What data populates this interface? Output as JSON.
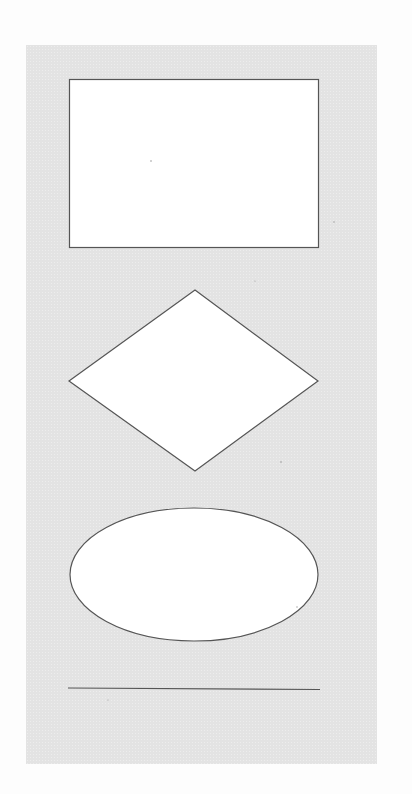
{
  "diagram": {
    "background_color": "#e3e3e3",
    "shape_fill": "#ffffff",
    "stroke_color": "#555555",
    "shapes": [
      {
        "type": "rectangle",
        "label": ""
      },
      {
        "type": "diamond",
        "label": ""
      },
      {
        "type": "ellipse",
        "label": ""
      },
      {
        "type": "line",
        "label": ""
      }
    ]
  }
}
